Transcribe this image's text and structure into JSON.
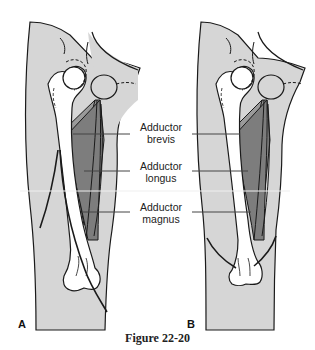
{
  "figure": {
    "caption": "Figure 22-20",
    "panels": [
      {
        "letter": "A"
      },
      {
        "letter": "B"
      }
    ],
    "labels": [
      {
        "line1": "Adductor",
        "line2": "brevis"
      },
      {
        "line1": "Adductor",
        "line2": "longus"
      },
      {
        "line1": "Adductor",
        "line2": "magnus"
      }
    ],
    "colors": {
      "skin": "#d4d4d4",
      "bone": "#ffffff",
      "muscle_dark": "#8a8a8a",
      "muscle_mid": "#a9a9a9",
      "outline": "#1a1a1a",
      "leader": "#444444"
    }
  }
}
